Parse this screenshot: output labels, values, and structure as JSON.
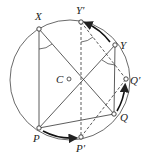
{
  "diagram": {
    "circle": {
      "cx": 70,
      "cy": 80,
      "r": 60
    },
    "center_label": "C",
    "points": [
      {
        "id": "X",
        "label": "X",
        "x": 39,
        "y": 29,
        "lx": 35,
        "ly": 20
      },
      {
        "id": "Yp",
        "label": "Y′",
        "x": 81,
        "y": 22,
        "lx": 76,
        "ly": 14
      },
      {
        "id": "Y",
        "label": "Y",
        "x": 115,
        "y": 45,
        "lx": 120,
        "ly": 49
      },
      {
        "id": "Qp",
        "label": "Q′",
        "x": 126,
        "y": 79,
        "lx": 130,
        "ly": 84
      },
      {
        "id": "Q",
        "label": "Q",
        "x": 114,
        "y": 114,
        "lx": 120,
        "ly": 121
      },
      {
        "id": "Pp",
        "label": "P′",
        "x": 81,
        "y": 137,
        "lx": 76,
        "ly": 152
      },
      {
        "id": "P",
        "label": "P",
        "x": 39,
        "y": 128,
        "lx": 33,
        "ly": 142
      }
    ]
  }
}
